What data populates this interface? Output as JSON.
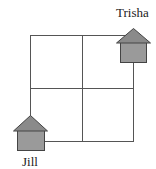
{
  "diagram": {
    "type": "grid-map",
    "grid": {
      "rows": 2,
      "cols": 2
    },
    "houses": [
      {
        "name": "Trisha",
        "position": "top-right corner"
      },
      {
        "name": "Jill",
        "position": "bottom-left corner"
      }
    ]
  },
  "labels": {
    "trisha": "Trisha",
    "jill": "Jill"
  },
  "colors": {
    "grid_line": "#555555",
    "roof": "#8a8a8a",
    "house_body": "#9a9a9a",
    "outline": "#444444"
  }
}
